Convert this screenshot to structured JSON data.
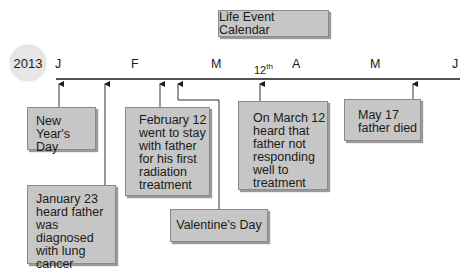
{
  "title": "Life Event Calendar",
  "year": "2013",
  "months": [
    "J",
    "F",
    "M",
    "A",
    "M",
    "J"
  ],
  "day_marker": {
    "number": "12",
    "suffix": "th"
  },
  "events": {
    "new_year": "New Year's Day",
    "jan23": [
      "January 23",
      "heard father",
      "was diagnosed",
      "with lung",
      "cancer"
    ],
    "feb12": [
      "February 12",
      "went to stay",
      "with father",
      "for his first",
      "radiation",
      "treatment"
    ],
    "valentines": "Valentine's Day",
    "mar12": [
      "On March 12",
      "heard that",
      "father not",
      "responding",
      "well to",
      "treatment"
    ],
    "may17": [
      "May 17",
      "father died"
    ]
  },
  "colors": {
    "box_fill": "#c6c6c6",
    "box_border": "#8a8a8a",
    "line": "#1a1a1a",
    "circle": "#e6e6e6"
  }
}
